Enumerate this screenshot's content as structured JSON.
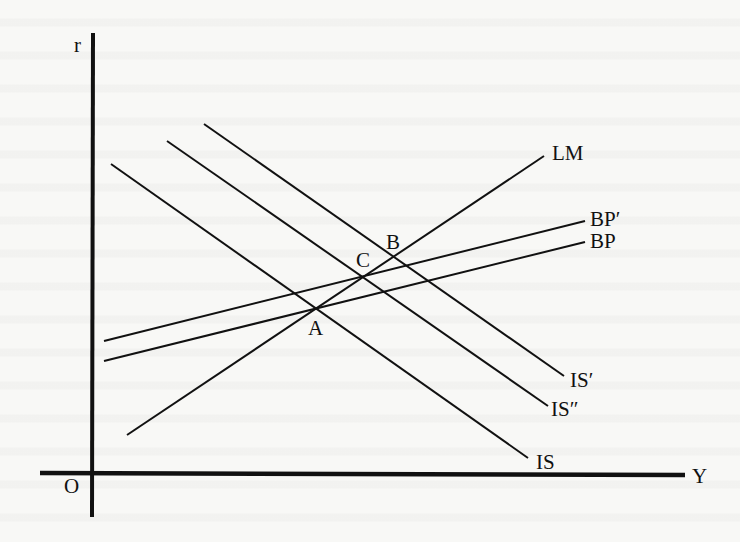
{
  "diagram": {
    "axes": {
      "y_axis_label": "r",
      "x_axis_label": "Y",
      "origin_label": "O"
    },
    "curves": [
      {
        "id": "lm",
        "label": "LM",
        "x1": 127,
        "y1": 435,
        "x2": 544,
        "y2": 156
      },
      {
        "id": "bp-prime",
        "label": "BP′",
        "x1": 104,
        "y1": 341,
        "x2": 585,
        "y2": 221
      },
      {
        "id": "bp",
        "label": "BP",
        "x1": 104,
        "y1": 361,
        "x2": 585,
        "y2": 242
      },
      {
        "id": "is",
        "label": "IS",
        "x1": 111,
        "y1": 164,
        "x2": 528,
        "y2": 458
      },
      {
        "id": "is-double-prime",
        "label": "IS″",
        "x1": 167,
        "y1": 141,
        "x2": 548,
        "y2": 406
      },
      {
        "id": "is-prime",
        "label": "IS′",
        "x1": 204,
        "y1": 124,
        "x2": 564,
        "y2": 376
      }
    ],
    "points": [
      {
        "id": "a",
        "label": "A"
      },
      {
        "id": "b",
        "label": "B"
      },
      {
        "id": "c",
        "label": "C"
      }
    ],
    "colors": {
      "ink": "#111111",
      "paper": "#f8f8f6"
    }
  }
}
